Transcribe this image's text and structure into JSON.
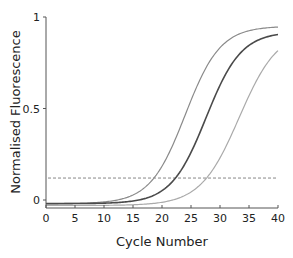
{
  "chart_data": {
    "type": "line",
    "title": "",
    "xlabel": "Cycle Number",
    "ylabel": "Normalised Fluorescence",
    "xlim": [
      0,
      40
    ],
    "ylim": [
      0,
      1
    ],
    "xticks": [
      0,
      5,
      10,
      15,
      20,
      25,
      30,
      35,
      40
    ],
    "yticks": [
      0,
      0.5,
      1
    ],
    "ytick_labels": [
      "0",
      "0.5",
      "1"
    ],
    "grid": false,
    "legend": null,
    "threshold": {
      "value": 0.12,
      "style": "dashed",
      "color": "#888888"
    },
    "series": [
      {
        "name": "sample-early",
        "color": "#8a8a8a",
        "width": 1.2,
        "midpoint": 24.0,
        "slope": 0.33,
        "top": 0.95,
        "baseline": -0.02,
        "x": [
          0,
          5,
          10,
          15,
          18,
          20,
          22,
          24,
          26,
          28,
          30,
          33,
          36,
          40
        ],
        "y": [
          -0.01,
          -0.02,
          -0.02,
          0.0,
          0.04,
          0.1,
          0.22,
          0.47,
          0.72,
          0.86,
          0.92,
          0.945,
          0.95,
          0.95
        ]
      },
      {
        "name": "sample-mid",
        "color": "#4a4a4a",
        "width": 1.6,
        "midpoint": 27.6,
        "slope": 0.33,
        "top": 0.92,
        "baseline": -0.02,
        "x": [
          0,
          5,
          10,
          15,
          20,
          22,
          24,
          26,
          28,
          30,
          32,
          34,
          37,
          40
        ],
        "y": [
          -0.01,
          -0.02,
          -0.02,
          -0.01,
          0.03,
          0.07,
          0.16,
          0.33,
          0.53,
          0.71,
          0.83,
          0.89,
          0.915,
          0.92
        ]
      },
      {
        "name": "sample-late",
        "color": "#aaaaaa",
        "width": 1.2,
        "midpoint": 33.3,
        "slope": 0.3,
        "top": 0.93,
        "baseline": -0.03,
        "x": [
          0,
          5,
          10,
          15,
          20,
          24,
          27,
          30,
          32,
          34,
          36,
          38,
          40
        ],
        "y": [
          -0.02,
          -0.03,
          -0.03,
          -0.03,
          -0.02,
          0.03,
          0.1,
          0.24,
          0.38,
          0.54,
          0.68,
          0.79,
          0.86
        ]
      }
    ]
  }
}
